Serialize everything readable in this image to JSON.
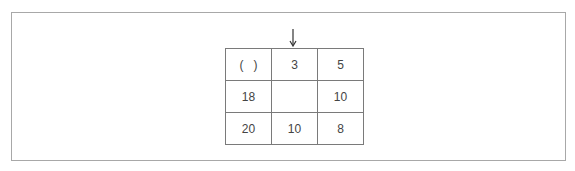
{
  "figure": {
    "arrow_column": 2,
    "grid": {
      "rows": [
        [
          "(   )",
          "3",
          "5"
        ],
        [
          "18",
          "",
          "10"
        ],
        [
          "20",
          "10",
          "8"
        ]
      ]
    }
  }
}
